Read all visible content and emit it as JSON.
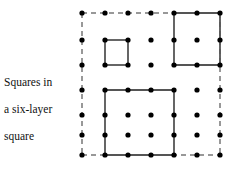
{
  "caption": {
    "line1": "Squares in",
    "line2": "a six-layer",
    "line3": "square"
  },
  "figure": {
    "name": "six-layer-square-lattice",
    "layers": 6,
    "grid": {
      "cols": 7,
      "rows": 7,
      "col_x": [
        82,
        105,
        128,
        151,
        174,
        197,
        220
      ],
      "row_y": [
        13,
        40,
        65,
        90,
        115,
        135,
        155
      ],
      "dot_radius": 2.6,
      "dot_color": "#000000"
    },
    "styles": {
      "solid_color": "#555555",
      "dashed_color": "#777777",
      "solid_width": 1.8,
      "dashed_width": 1.5,
      "dash_pattern": "5,4"
    },
    "boundary": {
      "label": "outer-six-layer-square",
      "style": "dashed",
      "col_from": 1,
      "col_to": 7,
      "row_from": 1,
      "row_to": 7
    },
    "squares": [
      {
        "label": "square-1x1",
        "size": 1,
        "col_from": 2,
        "col_to": 3,
        "row_from": 2,
        "row_to": 3,
        "style": "solid"
      },
      {
        "label": "square-2x2",
        "size": 2,
        "col_from": 5,
        "col_to": 7,
        "row_from": 1,
        "row_to": 3,
        "style": "solid"
      },
      {
        "label": "square-3x3",
        "size": 3,
        "col_from": 2,
        "col_to": 5,
        "row_from": 4,
        "row_to": 7,
        "style": "solid"
      }
    ]
  }
}
